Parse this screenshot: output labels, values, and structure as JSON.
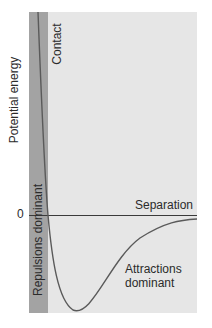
{
  "diagram": {
    "y_axis_label": "Potential energy",
    "zero_label": "0",
    "x_axis_label": "Separation",
    "regions": {
      "contact": "Contact",
      "repulsions": "Repulsions dominant",
      "attractions_line1": "Attractions",
      "attractions_line2": "dominant"
    },
    "colors": {
      "panel": "#e6e6e6",
      "repulsion_band": "#a3a3a3",
      "curve": "#5a5a5a",
      "axis_line": "#3a3a3a"
    }
  }
}
